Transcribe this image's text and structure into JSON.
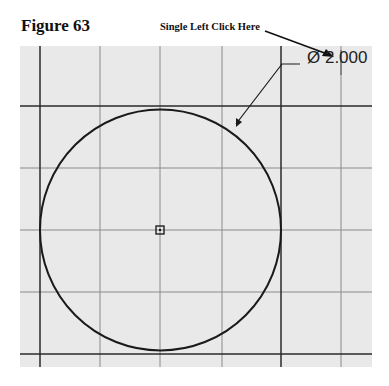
{
  "figure": {
    "title": "Figure 63",
    "callout": "Single Left Click Here"
  },
  "sketch": {
    "dimension_label": "Ø 2.000",
    "dimension_type": "diameter",
    "entity": "circle",
    "center_marker": "center-point",
    "colors": {
      "background": "#e9e9e9",
      "grid_minor": "#8a8a8a",
      "grid_major": "#2a2a2a",
      "geometry": "#1a1a1a"
    }
  }
}
